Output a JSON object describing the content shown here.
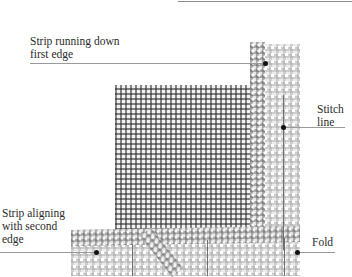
{
  "diagram": {
    "labels": {
      "strip_first_edge": "Strip running down\nfirst edge",
      "stitch_line": "Stitch\nline",
      "strip_second_edge": "Strip aligning\nwith second\nedge",
      "fold": "Fold"
    },
    "colors": {
      "text": "#2b2b2b",
      "leader_line": "#9a9a9a",
      "dot": "#111111",
      "background": "#ffffff"
    }
  }
}
